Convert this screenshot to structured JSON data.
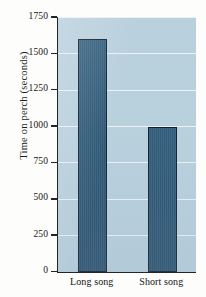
{
  "chart_data": {
    "type": "bar",
    "title": "",
    "xlabel": "",
    "ylabel": "Time on perch (seconds)",
    "categories": [
      "Long song",
      "Short song"
    ],
    "values": [
      1600,
      1000
    ],
    "ylim": [
      0,
      1750
    ],
    "yticks": [
      0,
      250,
      500,
      750,
      1000,
      1250,
      1500,
      1750
    ],
    "ytick_labels": [
      "0",
      "250",
      "500",
      "750",
      "1000",
      "1250",
      "1500",
      "1750"
    ],
    "grid": true,
    "legend": "none",
    "colors": {
      "bar_fill": "#2e5876",
      "bar_edge": "#14222e",
      "plot_background": "#b9d0dd",
      "gridline": "#eef4f7",
      "axis": "#20262b",
      "text": "#141414",
      "page_background": "#fdfdfb"
    }
  }
}
